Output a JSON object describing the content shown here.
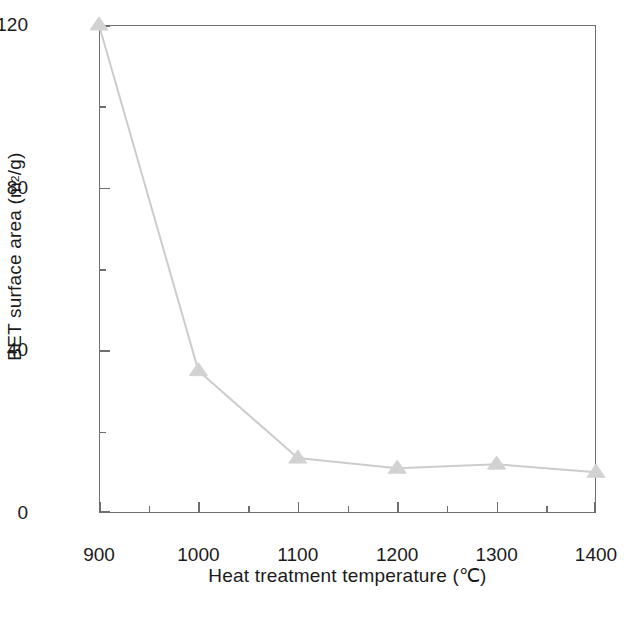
{
  "chart_data": {
    "type": "line",
    "title": "",
    "xlabel": "Heat treatment temperature (℃)",
    "ylabel_prefix": "BET surface area (m",
    "ylabel_sup": "2",
    "ylabel_suffix": "/g)",
    "ylabel_plain": "BET surface area (m2/g)",
    "x": [
      900,
      1000,
      1100,
      1200,
      1300,
      1400
    ],
    "values": [
      120,
      35,
      13.5,
      11,
      12,
      10
    ],
    "series": [
      {
        "name": "BET surface area",
        "marker": "triangle",
        "color": "#cccccc",
        "values": [
          120,
          35,
          13.5,
          11,
          12,
          10
        ]
      }
    ],
    "xlim": [
      900,
      1400
    ],
    "ylim": [
      0,
      120
    ],
    "xticks": [
      900,
      1000,
      1100,
      1200,
      1300,
      1400
    ],
    "xticklabels": [
      "900",
      "1000",
      "1100",
      "1200",
      "1300",
      "1400"
    ],
    "xminorticks": [
      950,
      1050,
      1150,
      1250,
      1350
    ],
    "yticks": [
      0,
      40,
      80,
      120
    ],
    "yticklabels": [
      "0",
      "40",
      "80",
      "120"
    ],
    "yminorticks": [
      20,
      60,
      100
    ],
    "grid": false,
    "legend": false
  },
  "style": {
    "axis_color": "#6e6e6e",
    "series_color": "#cccccc",
    "marker_color": "#d2d2d2",
    "text_color": "#1a1a1a",
    "background": "#ffffff"
  },
  "axis": {
    "y_labels": [
      "120",
      "80",
      "40",
      "0"
    ],
    "x_labels": [
      "900",
      "1000",
      "1100",
      "1200",
      "1300",
      "1400"
    ]
  }
}
